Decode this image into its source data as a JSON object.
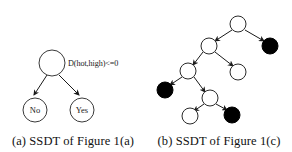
{
  "figure": {
    "background_color": "#ffffff",
    "line_color": "#1a1a1a",
    "leaf_fill_positive": "#000000",
    "leaf_fill_negative": "#ffffff"
  },
  "panels": [
    {
      "id": "a",
      "caption": "(a) SSDT of Figure 1(a)",
      "split_label": "D(hot,high)<=0",
      "nodes": [
        {
          "name": "root",
          "label": "",
          "fill": "white",
          "cx": 52,
          "cy": 63,
          "r": 13
        },
        {
          "name": "leaf-no",
          "label": "No",
          "fill": "white",
          "cx": 35,
          "cy": 110,
          "r": 12
        },
        {
          "name": "leaf-yes",
          "label": "Yes",
          "fill": "white",
          "cx": 82,
          "cy": 110,
          "r": 12
        }
      ],
      "edges": [
        {
          "from": "root",
          "to": "leaf-no"
        },
        {
          "from": "root",
          "to": "leaf-yes"
        }
      ]
    },
    {
      "id": "b",
      "caption": "(b) SSDT of Figure 1(c)",
      "split_label": "",
      "nodes": [
        {
          "name": "n1-root",
          "label": "",
          "fill": "white",
          "cx": 92,
          "cy": 24,
          "r": 8
        },
        {
          "name": "n2-internal",
          "label": "",
          "fill": "white",
          "cx": 63,
          "cy": 46,
          "r": 8
        },
        {
          "name": "n3-leaf-black",
          "label": "",
          "fill": "black",
          "cx": 124,
          "cy": 46,
          "r": 8
        },
        {
          "name": "n4-internal",
          "label": "",
          "fill": "white",
          "cx": 42,
          "cy": 71,
          "r": 8
        },
        {
          "name": "n5-leaf-white",
          "label": "",
          "fill": "white",
          "cx": 92,
          "cy": 72,
          "r": 8
        },
        {
          "name": "n6-leaf-black",
          "label": "",
          "fill": "black",
          "cx": 19,
          "cy": 90,
          "r": 8
        },
        {
          "name": "n7-internal",
          "label": "",
          "fill": "white",
          "cx": 64,
          "cy": 98,
          "r": 8
        },
        {
          "name": "n8-leaf-white",
          "label": "",
          "fill": "white",
          "cx": 44,
          "cy": 116,
          "r": 8
        },
        {
          "name": "n9-leaf-black",
          "label": "",
          "fill": "black",
          "cx": 86,
          "cy": 115,
          "r": 8
        }
      ],
      "edges": [
        {
          "from": "n1-root",
          "to": "n2-internal"
        },
        {
          "from": "n1-root",
          "to": "n3-leaf-black"
        },
        {
          "from": "n2-internal",
          "to": "n4-internal"
        },
        {
          "from": "n2-internal",
          "to": "n5-leaf-white"
        },
        {
          "from": "n4-internal",
          "to": "n6-leaf-black"
        },
        {
          "from": "n4-internal",
          "to": "n7-internal"
        },
        {
          "from": "n7-internal",
          "to": "n8-leaf-white"
        },
        {
          "from": "n7-internal",
          "to": "n9-leaf-black"
        }
      ]
    }
  ]
}
